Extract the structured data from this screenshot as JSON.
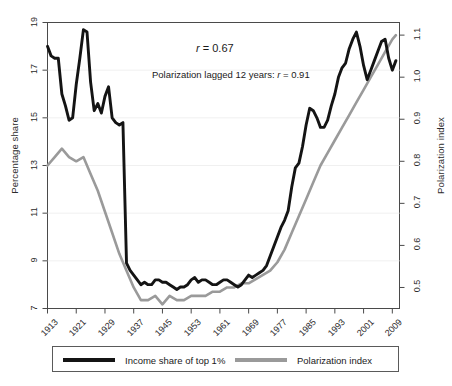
{
  "chart_data": {
    "type": "line",
    "title": "",
    "subtitle": "",
    "xlabel": "",
    "ylabel": "Percentage share",
    "ylabel_right": "Polarization index",
    "grid": true,
    "legend_position": "bottom",
    "xlim": [
      1913,
      2011
    ],
    "ylim": [
      7,
      19
    ],
    "ylim_right": [
      0.45,
      1.13
    ],
    "xticks": [
      1913,
      1921,
      1929,
      1937,
      1945,
      1953,
      1961,
      1969,
      1977,
      1985,
      1993,
      2001,
      2009
    ],
    "xtick_labels": [
      "1913",
      "1921",
      "1929",
      "1937",
      "1945",
      "1953",
      "1961",
      "1969",
      "1977",
      "1985",
      "1993",
      "2001",
      "2009"
    ],
    "yticks": [
      7,
      9,
      11,
      13,
      15,
      17,
      19
    ],
    "ytick_labels": [
      "7",
      "9",
      "11",
      "13",
      "15",
      "17",
      "19"
    ],
    "yticks_right": [
      0.5,
      0.6,
      0.7,
      0.8,
      0.9,
      1.0,
      1.1
    ],
    "ytick_labels_right": [
      "0.5",
      "0.6",
      "0.7",
      "0.8",
      "0.9",
      "1.0",
      "1.1"
    ],
    "annotations": [
      {
        "id": "correlation",
        "prefix": "r",
        "body": " = 0.67"
      },
      {
        "id": "lagged-correlation",
        "prefix": "Polarization lagged 12 years: ",
        "italic": "r",
        "body": " = 0.91"
      }
    ],
    "series": [
      {
        "name": "Income share of top 1%",
        "axis": "left",
        "color": "#141414",
        "x": [
          1913,
          1914,
          1915,
          1916,
          1917,
          1918,
          1919,
          1920,
          1921,
          1922,
          1923,
          1924,
          1925,
          1926,
          1927,
          1928,
          1929,
          1930,
          1931,
          1932,
          1933,
          1934,
          1935,
          1936,
          1937,
          1938,
          1939,
          1940,
          1941,
          1942,
          1943,
          1944,
          1945,
          1946,
          1947,
          1948,
          1949,
          1950,
          1951,
          1952,
          1953,
          1954,
          1955,
          1956,
          1957,
          1958,
          1959,
          1960,
          1961,
          1962,
          1963,
          1964,
          1965,
          1966,
          1967,
          1968,
          1969,
          1970,
          1971,
          1972,
          1973,
          1974,
          1975,
          1976,
          1977,
          1978,
          1979,
          1980,
          1981,
          1982,
          1983,
          1984,
          1985,
          1986,
          1987,
          1988,
          1989,
          1990,
          1991,
          1992,
          1993,
          1994,
          1995,
          1996,
          1997,
          1998,
          1999,
          2000,
          2001,
          2002,
          2003,
          2004,
          2005,
          2006,
          2007,
          2008,
          2009,
          2010
        ],
        "values": [
          18.0,
          17.6,
          17.5,
          17.5,
          16.0,
          15.5,
          14.9,
          15.0,
          16.4,
          17.5,
          18.7,
          18.6,
          16.5,
          15.3,
          15.6,
          15.2,
          15.9,
          16.3,
          15.0,
          14.8,
          14.7,
          14.8,
          8.9,
          8.6,
          8.4,
          8.2,
          8.0,
          8.1,
          8.0,
          8.0,
          8.2,
          8.2,
          8.1,
          8.1,
          8.0,
          7.9,
          7.8,
          7.9,
          7.9,
          8.0,
          8.2,
          8.3,
          8.1,
          8.2,
          8.2,
          8.1,
          8.0,
          8.0,
          8.1,
          8.2,
          8.2,
          8.1,
          8.0,
          7.9,
          8.0,
          8.2,
          8.4,
          8.3,
          8.4,
          8.5,
          8.6,
          8.8,
          9.2,
          9.6,
          10.0,
          10.4,
          10.7,
          11.1,
          12.1,
          12.9,
          13.1,
          13.8,
          14.7,
          15.4,
          15.3,
          15.0,
          14.6,
          14.6,
          14.9,
          15.5,
          16.0,
          16.7,
          17.1,
          17.3,
          17.9,
          18.3,
          18.6,
          18.0,
          17.2,
          16.6,
          17.0,
          17.4,
          17.8,
          18.2,
          18.3,
          17.5,
          17.0,
          17.4
        ]
      },
      {
        "name": "Polarization index",
        "axis": "right",
        "color": "#9a9a9a",
        "x": [
          1913,
          1915,
          1917,
          1919,
          1921,
          1923,
          1925,
          1927,
          1929,
          1931,
          1933,
          1935,
          1937,
          1939,
          1941,
          1943,
          1945,
          1947,
          1949,
          1951,
          1953,
          1955,
          1957,
          1959,
          1961,
          1963,
          1965,
          1967,
          1969,
          1971,
          1973,
          1975,
          1977,
          1979,
          1981,
          1983,
          1985,
          1987,
          1989,
          1991,
          1993,
          1995,
          1997,
          1999,
          2001,
          2003,
          2005,
          2007,
          2009,
          2010
        ],
        "values": [
          0.79,
          0.81,
          0.83,
          0.81,
          0.8,
          0.81,
          0.77,
          0.73,
          0.68,
          0.63,
          0.58,
          0.54,
          0.5,
          0.47,
          0.47,
          0.48,
          0.46,
          0.48,
          0.47,
          0.47,
          0.48,
          0.48,
          0.48,
          0.49,
          0.49,
          0.5,
          0.5,
          0.51,
          0.51,
          0.52,
          0.53,
          0.54,
          0.56,
          0.59,
          0.63,
          0.67,
          0.71,
          0.75,
          0.79,
          0.82,
          0.85,
          0.88,
          0.91,
          0.94,
          0.97,
          1.0,
          1.03,
          1.06,
          1.09,
          1.1
        ]
      }
    ]
  },
  "legend": {
    "entries": [
      {
        "label": "Income share of top 1%",
        "color": "#141414"
      },
      {
        "label": "Polarization index",
        "color": "#9a9a9a"
      }
    ]
  },
  "axes": {
    "left_title": "Percentage share",
    "right_title": "Polarization index"
  }
}
